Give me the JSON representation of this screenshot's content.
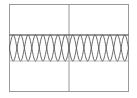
{
  "chart_data": {
    "type": "line",
    "title": "",
    "xlabel": "",
    "ylabel": "",
    "grid": false,
    "legend": null,
    "xlim": [
      0,
      8
    ],
    "ylim": [
      -1.7,
      1.7
    ],
    "center_line_x": 4,
    "periods": 8,
    "series": [
      {
        "name": "sin",
        "function": "sin(2*pi*x)",
        "amplitude": 1,
        "color": "#555555"
      },
      {
        "name": "-sin",
        "function": "-sin(2*pi*x)",
        "amplitude": 1,
        "color": "#555555"
      }
    ],
    "hlines": [
      {
        "y": 1,
        "color": "#333333"
      },
      {
        "y": -1,
        "color": "#bbbbbb"
      }
    ]
  },
  "colors": {
    "frame": "#999999",
    "wave": "#555555",
    "top_line": "#333333",
    "bottom_line": "#bbbbbb"
  }
}
